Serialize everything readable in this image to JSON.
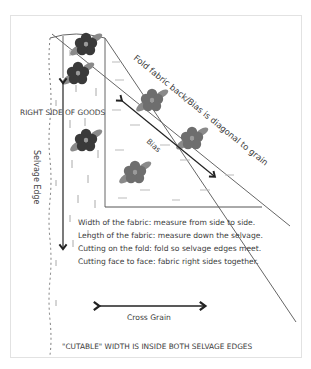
{
  "diagram": {
    "type": "fabric-grain-illustration",
    "labels": {
      "fold_line": "Fold fabric back/Bias is diagonal to grain",
      "right_side": "RIGHT SIDE OF GOODS",
      "bias": "Bias",
      "selvage": "Selvage Edge",
      "cross_grain": "Cross Grain",
      "cutable_width": "\"CUTABLE\" WIDTH IS INSIDE BOTH SELVAGE EDGES"
    },
    "notes": [
      "Width of the fabric: measure from side to side.",
      "Length of the fabric: measure down the selvage.",
      "Cutting on the fold: fold so selvage edges meet.",
      "Cutting face to face: fabric right sides together."
    ],
    "arrows": [
      {
        "name": "lengthwise-grain-arrow",
        "direction": "vertical, double-headed"
      },
      {
        "name": "bias-arrow",
        "direction": "diagonal, double-headed"
      },
      {
        "name": "cross-grain-arrow",
        "direction": "horizontal, double-headed"
      }
    ],
    "colors": {
      "frame": "#e2e2e2",
      "line": "#555555",
      "text": "#3c3c3c",
      "flower_dark": "#3a3a3a",
      "flower_light": "#6e6e6e",
      "leaf": "#8a8a8a"
    }
  }
}
